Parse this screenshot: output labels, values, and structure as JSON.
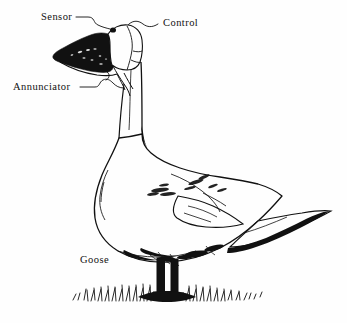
{
  "figure": {
    "style": "pen-and-ink line drawing",
    "background_color": "#fefefe",
    "ink_color": "#111111",
    "subject": "goose"
  },
  "labels": [
    {
      "id": "sensor",
      "text": "Sensor",
      "points_to": "eye",
      "has_leader_line": true
    },
    {
      "id": "control",
      "text": "Control",
      "points_to": "crown",
      "has_leader_line": true
    },
    {
      "id": "annunciator",
      "text": "Annunciator",
      "points_to": "throat",
      "has_leader_line": true
    },
    {
      "id": "goose",
      "text": "Goose",
      "points_to": "body",
      "has_leader_line": false
    }
  ],
  "parts": {
    "bill": "black wedge bill pointing left",
    "head": "white head with black eye",
    "neck": "long upright neck",
    "body": "white body with feather hatching",
    "wing": "folded wing with dark tips",
    "tail": "pointed tail extending right",
    "legs": "two solid black legs",
    "ground": "tuft of hatched grass"
  }
}
